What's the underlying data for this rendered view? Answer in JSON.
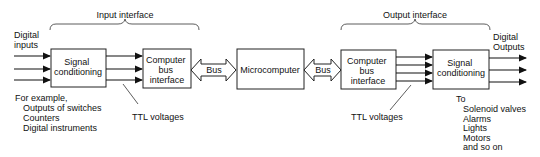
{
  "input_interface": {
    "label": "Input interface",
    "inputs_label": [
      "Digital",
      "inputs"
    ],
    "signal_conditioning": [
      "Signal",
      "conditioning"
    ],
    "bus_interface": [
      "Computer",
      "bus",
      "interface"
    ],
    "ttl_label": "TTL voltages",
    "examples": [
      "For example,",
      "Outputs of switches",
      "Counters",
      "Digital instruments"
    ]
  },
  "bus_left": "Bus",
  "microcomputer": "Microcomputer",
  "bus_right": "Bus",
  "output_interface": {
    "label": "Output interface",
    "bus_interface": [
      "Computer",
      "bus",
      "interface"
    ],
    "signal_conditioning": [
      "Signal",
      "conditioning"
    ],
    "outputs_label": [
      "Digital",
      "Outputs"
    ],
    "ttl_label": "TTL voltages",
    "destinations": [
      "To",
      "Solenoid valves",
      "Alarms",
      "Lights",
      "Motors",
      "and so on"
    ]
  }
}
